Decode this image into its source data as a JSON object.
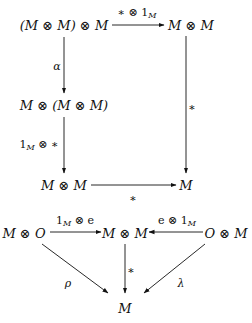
{
  "diagram": {
    "square": {
      "nodes": {
        "top_left": "(M ⊗ M) ⊗ M",
        "top_right": "M ⊗ M",
        "mid_left": "M ⊗ (M ⊗ M)",
        "bottom_left": "M ⊗ M",
        "bottom_right": "M"
      },
      "edges": {
        "top": {
          "base": "∗ ⊗ 1",
          "sub": "M",
          "from": "top_left",
          "to": "top_right"
        },
        "left_upper": {
          "label": "α",
          "from": "top_left",
          "to": "mid_left"
        },
        "left_lower": {
          "base": "1",
          "sub": "M",
          "suffix": " ⊗ ∗",
          "from": "mid_left",
          "to": "bottom_left"
        },
        "right": {
          "label": "∗",
          "from": "top_right",
          "to": "bottom_right"
        },
        "bottom": {
          "label": "∗",
          "from": "bottom_left",
          "to": "bottom_right"
        }
      }
    },
    "triangle": {
      "nodes": {
        "left": "M ⊗ O",
        "center": "M ⊗ M",
        "right": "O ⊗ M",
        "bottom": "M"
      },
      "edges": {
        "left_to_center": {
          "base": "1",
          "sub": "M",
          "suffix": " ⊗ e"
        },
        "right_to_center": {
          "prefix": "e ⊗ 1",
          "sub": "M"
        },
        "center_to_bottom": {
          "label": "∗"
        },
        "left_to_bottom": {
          "label": "ρ"
        },
        "right_to_bottom": {
          "label": "λ"
        }
      }
    }
  }
}
